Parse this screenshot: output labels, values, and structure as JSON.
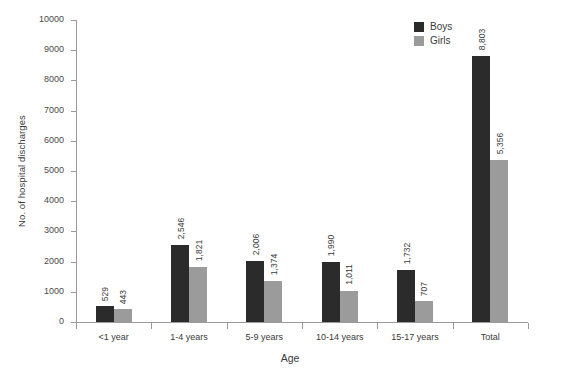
{
  "chart_data": {
    "type": "bar",
    "title": "",
    "subtitle": "",
    "xlabel": "Age",
    "ylabel": "No. of hospital discharges",
    "categories": [
      "<1 year",
      "1-4 years",
      "5-9 years",
      "10-14 years",
      "15-17 years",
      "Total"
    ],
    "series": [
      {
        "name": "Boys",
        "color": "#2b2b2b",
        "values": [
          529,
          2546,
          2006,
          1990,
          1732,
          8803
        ],
        "labels": [
          "529",
          "2,546",
          "2,006",
          "1,990",
          "1,732",
          "8,803"
        ]
      },
      {
        "name": "Girls",
        "color": "#9b9b9b",
        "values": [
          443,
          1821,
          1374,
          1011,
          707,
          5356
        ],
        "labels": [
          "443",
          "1,821",
          "1,374",
          "1,011",
          "707",
          "5,356"
        ]
      }
    ],
    "ylim": [
      0,
      10000
    ],
    "yticks": [
      0,
      1000,
      2000,
      3000,
      4000,
      5000,
      6000,
      7000,
      8000,
      9000,
      10000
    ],
    "ytick_labels": [
      "0",
      "1000",
      "2000",
      "3000",
      "4000",
      "5000",
      "6000",
      "7000",
      "8000",
      "9000",
      "10000"
    ],
    "grid": false,
    "legend_position": "top-right",
    "legend_entries": [
      "Boys",
      "Girls"
    ]
  }
}
